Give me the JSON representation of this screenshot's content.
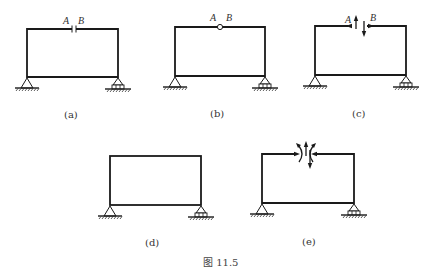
{
  "figure": {
    "caption": "图 11.5",
    "panels": [
      {
        "id": "a",
        "label": "(a)",
        "point_a": "A",
        "point_b": "B",
        "cut_type": "gap-cut"
      },
      {
        "id": "b",
        "label": "(b)",
        "point_a": "A",
        "point_b": "B",
        "cut_type": "hinge"
      },
      {
        "id": "c",
        "label": "(c)",
        "point_a": "A",
        "point_b": "B",
        "cut_type": "force-pairs"
      },
      {
        "id": "d",
        "label": "(d)",
        "cut_type": "none"
      },
      {
        "id": "e",
        "label": "(e)",
        "cut_type": "force-and-moment-pairs"
      }
    ],
    "supports": {
      "left": "pin-support",
      "right": "roller-support"
    },
    "colors": {
      "line": "#1a1a1a",
      "background": "#ffffff"
    }
  }
}
